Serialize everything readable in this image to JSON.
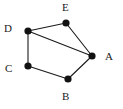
{
  "figure": {
    "background_color": "#ffffff",
    "node_color": "#121212",
    "edge_color": "#1a1a1a",
    "width": 123,
    "height": 109
  },
  "graph": {
    "type": "undirected-graph",
    "node_count": 5,
    "edge_count": 6,
    "nodes": [
      {
        "id": "A",
        "label": "A",
        "x": 92,
        "y": 56,
        "r": 3.6,
        "label_x": 105,
        "label_y": 51
      },
      {
        "id": "B",
        "label": "B",
        "x": 68,
        "y": 79,
        "r": 3.6,
        "label_x": 62,
        "label_y": 91
      },
      {
        "id": "C",
        "label": "C",
        "x": 28,
        "y": 66,
        "r": 3.6,
        "label_x": 5,
        "label_y": 63
      },
      {
        "id": "D",
        "label": "D",
        "x": 28,
        "y": 31,
        "r": 3.6,
        "label_x": 4,
        "label_y": 23
      },
      {
        "id": "E",
        "label": "E",
        "x": 66,
        "y": 23,
        "r": 3.6,
        "label_x": 62,
        "label_y": 2
      }
    ],
    "edges": [
      {
        "id": "D-E",
        "from": "D",
        "to": "E"
      },
      {
        "id": "E-A",
        "from": "E",
        "to": "A"
      },
      {
        "id": "D-A",
        "from": "D",
        "to": "A"
      },
      {
        "id": "D-C",
        "from": "D",
        "to": "C"
      },
      {
        "id": "C-B",
        "from": "C",
        "to": "B"
      },
      {
        "id": "B-A",
        "from": "B",
        "to": "A"
      }
    ]
  }
}
